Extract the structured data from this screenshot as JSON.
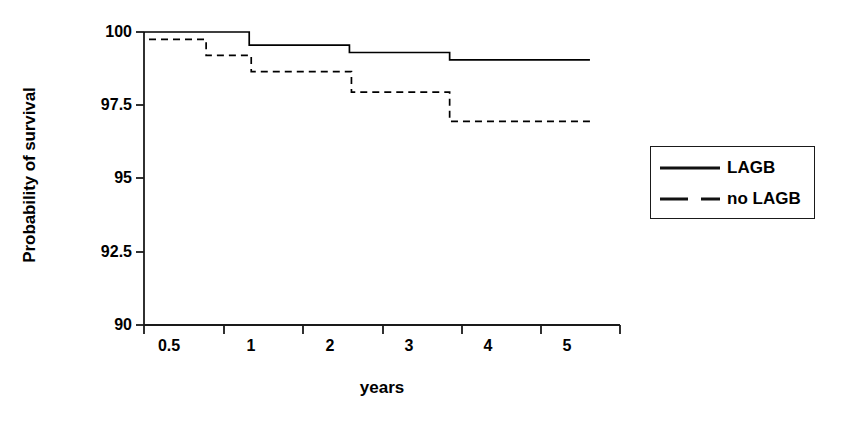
{
  "chart_data": {
    "type": "line",
    "subtype": "kaplan-meier-step",
    "title": "",
    "xlabel": "years",
    "ylabel": "Probability of survival",
    "xlim": [
      0.25,
      5.0
    ],
    "ylim": [
      90,
      100
    ],
    "grid": false,
    "x_ticks": [
      0.5,
      1,
      2,
      3,
      4,
      5
    ],
    "x_tick_labels": [
      "0.5",
      "1",
      "2",
      "3",
      "4",
      "5"
    ],
    "y_ticks": [
      90,
      92.5,
      95,
      97.5,
      100
    ],
    "y_tick_labels": [
      "90",
      "92.5",
      "95",
      "97.5",
      "100"
    ],
    "legend_position": "right",
    "series": [
      {
        "name": "LAGB",
        "style": "solid",
        "color": "#000000",
        "steps": [
          {
            "x": 0.25,
            "y": 100.0
          },
          {
            "x": 1.3,
            "y": 100.0
          },
          {
            "x": 1.3,
            "y": 99.55
          },
          {
            "x": 2.3,
            "y": 99.55
          },
          {
            "x": 2.3,
            "y": 99.3
          },
          {
            "x": 3.3,
            "y": 99.3
          },
          {
            "x": 3.3,
            "y": 99.05
          },
          {
            "x": 4.7,
            "y": 99.05
          }
        ]
      },
      {
        "name": "no LAGB",
        "style": "dashed",
        "color": "#000000",
        "steps": [
          {
            "x": 0.3,
            "y": 99.75
          },
          {
            "x": 0.87,
            "y": 99.75
          },
          {
            "x": 0.87,
            "y": 99.2
          },
          {
            "x": 1.32,
            "y": 99.2
          },
          {
            "x": 1.32,
            "y": 98.65
          },
          {
            "x": 2.32,
            "y": 98.65
          },
          {
            "x": 2.32,
            "y": 97.95
          },
          {
            "x": 3.3,
            "y": 97.95
          },
          {
            "x": 3.3,
            "y": 96.95
          },
          {
            "x": 4.7,
            "y": 96.95
          }
        ]
      }
    ]
  },
  "axes": {
    "y_title": "Probability of survival",
    "x_title": "years",
    "y_tick_labels": [
      "100",
      "97.5",
      "95",
      "92.5",
      "90"
    ],
    "x_tick_labels": [
      "0.5",
      "1",
      "2",
      "3",
      "4",
      "5"
    ]
  },
  "legend": {
    "items": [
      {
        "label": "LAGB",
        "style": "solid"
      },
      {
        "label": "no LAGB",
        "style": "dashed"
      }
    ]
  },
  "colors": {
    "line": "#000000",
    "axis": "#1a1a1a",
    "background": "#ffffff"
  }
}
